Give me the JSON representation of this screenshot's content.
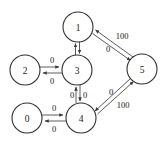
{
  "diagram": {
    "background_color": "#ffffff",
    "node_fill": "#ffffff",
    "node_stroke": "#303030",
    "edge_color": "#4a4a4a",
    "text_color": "#202020"
  },
  "nodes": [
    {
      "id": "n1",
      "label": "1",
      "cx": 78,
      "cy": 27,
      "r": 15
    },
    {
      "id": "n5",
      "label": "5",
      "cx": 142,
      "cy": 69,
      "r": 15
    },
    {
      "id": "n2",
      "label": "2",
      "cx": 25,
      "cy": 70,
      "r": 15
    },
    {
      "id": "n3",
      "label": "3",
      "cx": 77,
      "cy": 70,
      "r": 15
    },
    {
      "id": "n0",
      "label": "0",
      "cx": 27,
      "cy": 118,
      "r": 15
    },
    {
      "id": "n4",
      "label": "4",
      "cx": 81,
      "cy": 118,
      "r": 15
    }
  ],
  "edges": [
    {
      "id": "e-1-5",
      "from": "1",
      "to": "5",
      "weight": "100",
      "label_x": 122,
      "label_y": 36
    },
    {
      "id": "e-5-1",
      "from": "5",
      "to": "1",
      "weight": "0",
      "label_x": 108,
      "label_y": 49
    },
    {
      "id": "e-5-4",
      "from": "5",
      "to": "4",
      "weight": "0",
      "label_x": 111,
      "label_y": 92
    },
    {
      "id": "e-4-5",
      "from": "4",
      "to": "5",
      "weight": "100",
      "label_x": 123,
      "label_y": 105
    },
    {
      "id": "e-2-3",
      "from": "2",
      "to": "3",
      "weight": "0",
      "label_x": 52,
      "label_y": 60
    },
    {
      "id": "e-3-2",
      "from": "3",
      "to": "2",
      "weight": "0",
      "label_x": 52,
      "label_y": 81
    },
    {
      "id": "e-3-4",
      "from": "3",
      "to": "4",
      "weight": "0",
      "label_x": 85,
      "label_y": 95
    },
    {
      "id": "e-4-3",
      "from": "4",
      "to": "3",
      "weight": "0",
      "label_x": 72,
      "label_y": 95
    },
    {
      "id": "e-0-4",
      "from": "0",
      "to": "4",
      "weight": "0",
      "label_x": 54,
      "label_y": 108
    },
    {
      "id": "e-4-0",
      "from": "4",
      "to": "0",
      "weight": "0",
      "label_x": 54,
      "label_y": 129
    },
    {
      "id": "e-1-3",
      "from": "1",
      "to": "3",
      "weight": "",
      "label_x": 0,
      "label_y": 0
    },
    {
      "id": "e-3-1",
      "from": "3",
      "to": "1",
      "weight": "",
      "label_x": 0,
      "label_y": 0
    }
  ]
}
